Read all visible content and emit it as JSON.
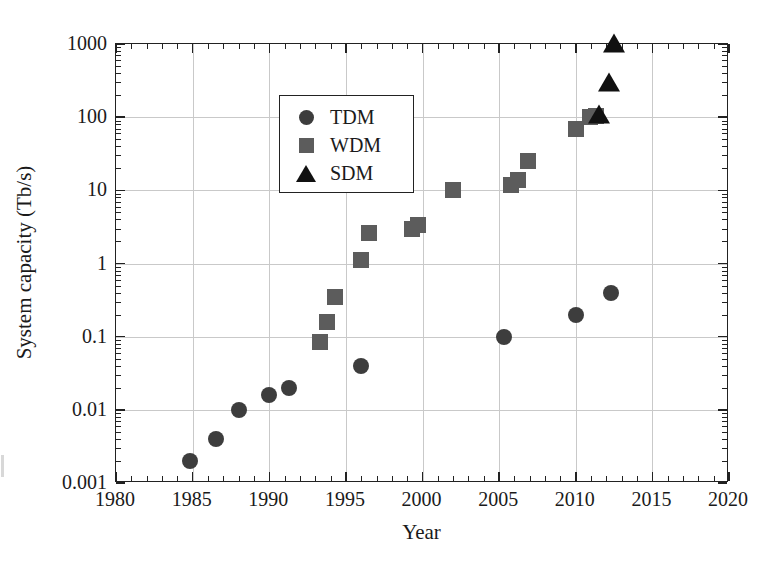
{
  "chart_data": {
    "type": "scatter",
    "title": "",
    "xlabel": "Year",
    "ylabel": "System capacity (Tb/s)",
    "yscale": "log",
    "xlim": [
      1980,
      2020
    ],
    "ylim": [
      0.001,
      1000
    ],
    "grid": true,
    "legend_position": "top-left",
    "xticks": [
      1980,
      1985,
      1990,
      1995,
      2000,
      2005,
      2010,
      2015,
      2020
    ],
    "xtick_labels": [
      "1980",
      "1985",
      "1990",
      "1995",
      "2000",
      "2005",
      "2010",
      "2015",
      "2020"
    ],
    "xminor_tick_step": 1,
    "yticks": [
      0.001,
      0.01,
      0.1,
      1,
      10,
      100,
      1000
    ],
    "ytick_labels": [
      "0.001",
      "0.01",
      "0.1",
      "1",
      "10",
      "100",
      "1000"
    ],
    "series": [
      {
        "name": "TDM",
        "marker": "circle",
        "color": "#3d3d3d",
        "points": [
          {
            "x": 1984.8,
            "y": 0.002
          },
          {
            "x": 1986.5,
            "y": 0.004
          },
          {
            "x": 1988.0,
            "y": 0.01
          },
          {
            "x": 1990.0,
            "y": 0.016
          },
          {
            "x": 1991.3,
            "y": 0.02
          },
          {
            "x": 1996.0,
            "y": 0.04
          },
          {
            "x": 2005.3,
            "y": 0.1
          },
          {
            "x": 2010.0,
            "y": 0.2
          },
          {
            "x": 2012.3,
            "y": 0.4
          }
        ]
      },
      {
        "name": "WDM",
        "marker": "square",
        "color": "#5c5c5c",
        "points": [
          {
            "x": 1993.3,
            "y": 0.085
          },
          {
            "x": 1993.8,
            "y": 0.16
          },
          {
            "x": 1994.3,
            "y": 0.35
          },
          {
            "x": 1996.0,
            "y": 1.1
          },
          {
            "x": 1996.5,
            "y": 2.6
          },
          {
            "x": 1999.3,
            "y": 3.0
          },
          {
            "x": 1999.7,
            "y": 3.4
          },
          {
            "x": 2002.0,
            "y": 10.0
          },
          {
            "x": 2005.8,
            "y": 12.0
          },
          {
            "x": 2006.2,
            "y": 14.0
          },
          {
            "x": 2006.9,
            "y": 25.0
          },
          {
            "x": 2010.0,
            "y": 70.0
          },
          {
            "x": 2010.9,
            "y": 100.0
          },
          {
            "x": 2011.3,
            "y": 105.0
          }
        ]
      },
      {
        "name": "SDM",
        "marker": "triangle",
        "color": "#111111",
        "points": [
          {
            "x": 2011.5,
            "y": 110.0
          },
          {
            "x": 2012.2,
            "y": 305.0
          },
          {
            "x": 2012.5,
            "y": 1020.0
          }
        ]
      }
    ]
  },
  "legend": {
    "entries": [
      {
        "label": "TDM",
        "marker": "circle"
      },
      {
        "label": "WDM",
        "marker": "square"
      },
      {
        "label": "SDM",
        "marker": "triangle"
      }
    ]
  }
}
